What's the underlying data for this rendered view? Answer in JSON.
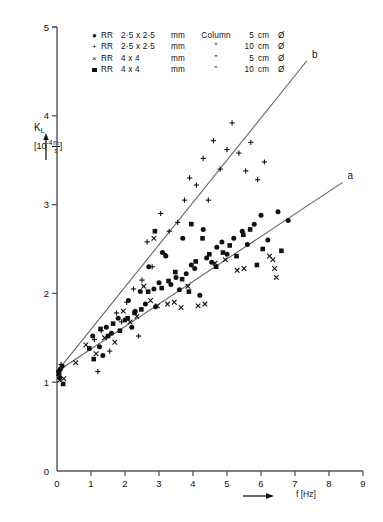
{
  "chart_data": {
    "type": "scatter",
    "title": "",
    "xlabel": "f [Hz]",
    "ylabel": "K_L",
    "ylabel_main": "K",
    "ylabel_sub": "L",
    "yunit_prefix": "[10",
    "yunit_exp": "-4",
    "yunit_num": "m",
    "yunit_den": "s",
    "yunit_suffix": "]",
    "xlim": [
      0,
      9
    ],
    "ylim": [
      0,
      5
    ],
    "xticks": [
      "0",
      "1",
      "2",
      "3",
      "4",
      "5",
      "6",
      "7",
      "8",
      "9"
    ],
    "yticks": [
      "0",
      "1",
      "2",
      "3",
      "4",
      "5"
    ],
    "grid": false,
    "legend_position": "top-center",
    "series": [
      {
        "name": "RR 2.5 x 2.5 mm Column 5 cm diameter",
        "marker": "filled-circle",
        "points": [
          [
            0.05,
            1.12
          ],
          [
            0.1,
            1.15
          ],
          [
            0.08,
            1.05
          ],
          [
            0.15,
            1.18
          ],
          [
            1.05,
            1.52
          ],
          [
            1.25,
            1.4
          ],
          [
            1.45,
            1.62
          ],
          [
            1.6,
            1.55
          ],
          [
            1.8,
            1.72
          ],
          [
            2.0,
            1.7
          ],
          [
            2.1,
            1.92
          ],
          [
            2.3,
            1.8
          ],
          [
            2.45,
            2.02
          ],
          [
            2.6,
            1.88
          ],
          [
            2.7,
            2.3
          ],
          [
            2.85,
            2.05
          ],
          [
            3.0,
            2.12
          ],
          [
            3.1,
            2.46
          ],
          [
            3.2,
            2.42
          ],
          [
            3.35,
            2.1
          ],
          [
            3.5,
            2.18
          ],
          [
            3.6,
            2.04
          ],
          [
            3.8,
            2.22
          ],
          [
            3.95,
            2.32
          ],
          [
            4.05,
            2.28
          ],
          [
            4.2,
            1.98
          ],
          [
            4.4,
            2.4
          ],
          [
            4.55,
            2.35
          ],
          [
            4.7,
            2.52
          ],
          [
            4.85,
            2.58
          ],
          [
            5.0,
            2.44
          ],
          [
            5.2,
            2.62
          ],
          [
            5.45,
            2.7
          ],
          [
            5.6,
            2.55
          ],
          [
            5.8,
            2.78
          ],
          [
            6.0,
            2.88
          ],
          [
            6.2,
            2.6
          ],
          [
            6.5,
            2.92
          ],
          [
            6.8,
            2.82
          ],
          [
            1.35,
            1.3
          ],
          [
            2.2,
            1.62
          ],
          [
            2.9,
            1.85
          ],
          [
            3.7,
            2.62
          ],
          [
            4.3,
            2.72
          ]
        ]
      },
      {
        "name": "RR 2.5 x 2.5 mm Column 10 cm diameter",
        "marker": "plus",
        "points": [
          [
            0.05,
            1.08
          ],
          [
            0.12,
            1.2
          ],
          [
            1.1,
            1.48
          ],
          [
            1.3,
            1.58
          ],
          [
            1.55,
            1.35
          ],
          [
            1.75,
            1.78
          ],
          [
            2.05,
            1.9
          ],
          [
            2.25,
            2.05
          ],
          [
            2.5,
            2.15
          ],
          [
            2.65,
            2.58
          ],
          [
            2.8,
            2.3
          ],
          [
            3.05,
            2.9
          ],
          [
            3.15,
            2.45
          ],
          [
            3.3,
            2.7
          ],
          [
            3.55,
            2.8
          ],
          [
            3.75,
            3.05
          ],
          [
            3.9,
            3.3
          ],
          [
            4.1,
            3.22
          ],
          [
            4.3,
            3.52
          ],
          [
            4.45,
            3.05
          ],
          [
            4.6,
            3.72
          ],
          [
            4.8,
            3.4
          ],
          [
            5.0,
            3.62
          ],
          [
            5.15,
            3.92
          ],
          [
            5.35,
            3.58
          ],
          [
            5.55,
            3.38
          ],
          [
            5.7,
            3.7
          ],
          [
            5.9,
            3.28
          ],
          [
            6.1,
            3.48
          ],
          [
            1.9,
            1.68
          ],
          [
            2.4,
            1.52
          ],
          [
            1.2,
            1.12
          ]
        ]
      },
      {
        "name": "RR 4 x 4 mm Column 5 cm diameter",
        "marker": "cross",
        "points": [
          [
            0.08,
            1.02
          ],
          [
            0.2,
            1.04
          ],
          [
            0.85,
            1.42
          ],
          [
            1.15,
            1.32
          ],
          [
            1.4,
            1.5
          ],
          [
            1.7,
            1.45
          ],
          [
            1.95,
            1.8
          ],
          [
            2.15,
            1.68
          ],
          [
            2.35,
            1.74
          ],
          [
            2.55,
            2.08
          ],
          [
            2.75,
            1.92
          ],
          [
            2.95,
            1.86
          ],
          [
            3.25,
            1.88
          ],
          [
            3.45,
            1.9
          ],
          [
            3.65,
            1.84
          ],
          [
            3.85,
            2.08
          ],
          [
            4.15,
            1.86
          ],
          [
            4.35,
            1.88
          ],
          [
            4.65,
            2.34
          ],
          [
            4.95,
            2.38
          ],
          [
            5.3,
            2.26
          ],
          [
            5.5,
            2.28
          ],
          [
            6.25,
            2.42
          ],
          [
            6.35,
            2.38
          ],
          [
            6.4,
            2.28
          ],
          [
            6.45,
            2.18
          ],
          [
            2.85,
            2.62
          ],
          [
            0.55,
            1.22
          ]
        ]
      },
      {
        "name": "RR 4 x 4 mm Column 10 cm diameter",
        "marker": "filled-square",
        "points": [
          [
            0.06,
            1.1
          ],
          [
            0.18,
            0.98
          ],
          [
            0.95,
            1.38
          ],
          [
            1.28,
            1.6
          ],
          [
            1.5,
            1.52
          ],
          [
            1.65,
            1.66
          ],
          [
            1.85,
            1.58
          ],
          [
            2.08,
            1.72
          ],
          [
            2.28,
            1.78
          ],
          [
            2.48,
            1.82
          ],
          [
            2.68,
            2.02
          ],
          [
            2.88,
            2.7
          ],
          [
            3.08,
            2.06
          ],
          [
            3.28,
            2.14
          ],
          [
            3.48,
            2.24
          ],
          [
            3.68,
            2.16
          ],
          [
            3.88,
            2.02
          ],
          [
            4.08,
            2.36
          ],
          [
            4.28,
            2.62
          ],
          [
            4.48,
            2.44
          ],
          [
            4.68,
            2.3
          ],
          [
            4.88,
            2.46
          ],
          [
            5.08,
            2.54
          ],
          [
            5.28,
            2.42
          ],
          [
            5.48,
            2.66
          ],
          [
            5.68,
            2.72
          ],
          [
            5.88,
            2.32
          ],
          [
            6.05,
            2.5
          ],
          [
            6.6,
            2.48
          ],
          [
            1.08,
            1.26
          ],
          [
            3.95,
            2.78
          ]
        ]
      }
    ],
    "fit_lines": [
      {
        "label": "a",
        "name": "fit-line-a",
        "x0": 0.0,
        "y0": 1.12,
        "x1": 8.4,
        "y1": 3.25
      },
      {
        "label": "b",
        "name": "fit-line-b",
        "x0": 0.0,
        "y0": 1.12,
        "x1": 7.35,
        "y1": 4.62
      }
    ],
    "legend": {
      "rows": [
        {
          "marker": "filled-circle",
          "packing": "RR",
          "size": "2·5 x 2·5",
          "unit": "mm",
          "column": "Column",
          "diameter": "5",
          "cm": "cm",
          "dia_sym": "Ø"
        },
        {
          "marker": "plus",
          "packing": "RR",
          "size": "2·5 x 2·5",
          "unit": "mm",
          "column": "”",
          "diameter": "10",
          "cm": "cm",
          "dia_sym": "Ø"
        },
        {
          "marker": "cross",
          "packing": "RR",
          "size": "4 x 4",
          "unit": "mm",
          "column": "”",
          "diameter": "5",
          "cm": "cm",
          "dia_sym": "Ø"
        },
        {
          "marker": "filled-square",
          "packing": "RR",
          "size": "4 x 4",
          "unit": "mm",
          "column": "”",
          "diameter": "10",
          "cm": "cm",
          "dia_sym": "Ø"
        }
      ]
    },
    "colors": {
      "ink": "#1a1a1a",
      "axis": "#555555",
      "marker": "#111111",
      "line": "#666666",
      "background": "#ffffff"
    }
  }
}
